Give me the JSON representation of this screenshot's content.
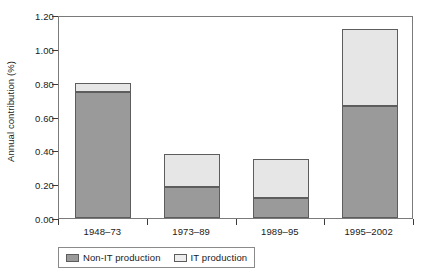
{
  "chart_data": {
    "type": "bar",
    "stacked": true,
    "title": "",
    "xlabel": "",
    "ylabel": "Annual contribution (%)",
    "categories": [
      "1948–73",
      "1973–89",
      "1989–95",
      "1995–2002"
    ],
    "series": [
      {
        "name": "Non-IT production",
        "color": "#9a9a9a",
        "values": [
          0.745,
          0.185,
          0.12,
          0.665
        ]
      },
      {
        "name": "IT production",
        "color": "#e6e6e6",
        "values": [
          0.055,
          0.195,
          0.23,
          0.455
        ]
      }
    ],
    "totals": [
      0.8,
      0.38,
      0.35,
      1.12
    ],
    "ylim": [
      0.0,
      1.2
    ],
    "ytick_step": 0.2,
    "ytick_labels": [
      "0.00",
      "0.20",
      "0.40",
      "0.60",
      "0.80",
      "1.00",
      "1.20"
    ],
    "ytick_values": [
      0.0,
      0.2,
      0.4,
      0.6,
      0.8,
      1.0,
      1.2
    ],
    "grid": false,
    "legend_position": "bottom-left",
    "legend_entries": [
      "Non-IT production",
      "IT production"
    ]
  }
}
